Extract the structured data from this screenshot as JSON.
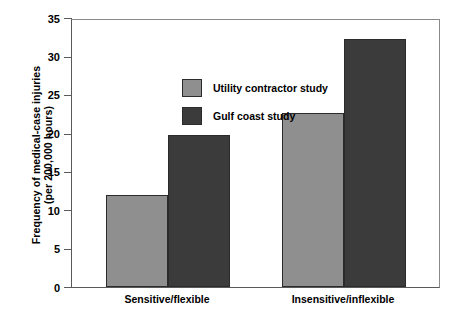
{
  "chart_data": {
    "type": "bar",
    "title": "",
    "xlabel": "",
    "ylabel_line1": "Frequency of medical-case injuries",
    "ylabel_line2": "(per 200,000 hours)",
    "categories": [
      "Sensitive/flexible",
      "Insensitive/inflexible"
    ],
    "series": [
      {
        "name": "Utility contractor study",
        "color": "#8f8f8f",
        "values": [
          12.2,
          22.9
        ]
      },
      {
        "name": "Gulf coast study",
        "color": "#3b3b3b",
        "values": [
          20.0,
          32.5
        ]
      }
    ],
    "ylim": [
      0,
      35
    ],
    "ytick_values": [
      0,
      5,
      10,
      15,
      20,
      25,
      30,
      35
    ],
    "ytick_labels": [
      "0",
      "5",
      "10",
      "15",
      "20",
      "25",
      "30",
      "35"
    ],
    "grid": false,
    "legend_position": "upper-left-inside"
  },
  "legend": {
    "items": [
      {
        "label": "Utility contractor study",
        "color": "#8f8f8f"
      },
      {
        "label": "Gulf coast study",
        "color": "#3b3b3b"
      }
    ]
  },
  "colors": {
    "series_light": "#8f8f8f",
    "series_dark": "#3b3b3b",
    "bar_border": "#2b2b2b",
    "axis": "#5a5a5a",
    "frame": "#8a8a8a",
    "background": "#ffffff"
  }
}
